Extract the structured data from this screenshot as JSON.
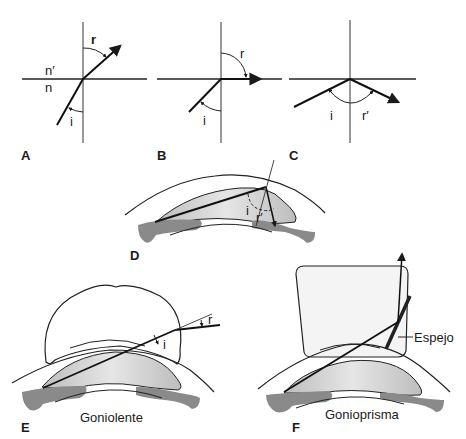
{
  "figure": {
    "panels": [
      {
        "id": "A",
        "letter": "A",
        "labels": {
          "refracted": "r",
          "incident": "i",
          "medium_upper": "n′",
          "medium_lower": "n"
        }
      },
      {
        "id": "B",
        "letter": "B",
        "labels": {
          "refracted": "r",
          "incident": "i"
        }
      },
      {
        "id": "C",
        "letter": "C",
        "labels": {
          "incident": "i",
          "reflected": "r′"
        }
      },
      {
        "id": "D",
        "letter": "D",
        "labels": {
          "incident": "i",
          "reflected": "r′"
        }
      },
      {
        "id": "E",
        "letter": "E",
        "labels": {
          "refracted": "r",
          "incident": "i"
        },
        "caption": "Goniolente"
      },
      {
        "id": "F",
        "letter": "F",
        "labels": {
          "mirror": "Espejo"
        },
        "caption": "Gonioprisma"
      }
    ]
  },
  "colors": {
    "line": "#1a1a1a",
    "tissue_gray": "#8a8a8a",
    "chamber_fill": "#d4d4d4",
    "prism_fill": "#f4f4f4"
  }
}
